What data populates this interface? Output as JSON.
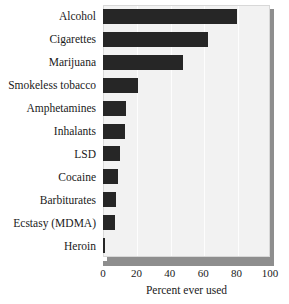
{
  "chart_data": {
    "type": "bar",
    "orientation": "horizontal",
    "title": "",
    "subtitle": "",
    "xlabel": "Percent ever used",
    "ylabel": "",
    "xlim": [
      0,
      100
    ],
    "xticks": [
      "0",
      "20",
      "40",
      "60",
      "80",
      "100"
    ],
    "xtick_values": [
      0,
      20,
      40,
      60,
      80,
      100
    ],
    "grid": "vertical",
    "legend": "none",
    "categories": [
      "Alcohol",
      "Cigarettes",
      "Marijuana",
      "Smokeless tobacco",
      "Amphetamines",
      "Inhalants",
      "LSD",
      "Cocaine",
      "Barbiturates",
      "Ecstasy (MDMA)",
      "Heroin"
    ],
    "values": [
      80,
      63,
      48,
      21,
      14,
      13,
      10,
      9,
      8,
      7,
      1
    ],
    "series": [
      {
        "name": "Percent ever used",
        "values": [
          80,
          63,
          48,
          21,
          14,
          13,
          10,
          9,
          8,
          7,
          1
        ]
      }
    ],
    "colors": {
      "bar": "#262626",
      "plot_background": "#f2f2f2",
      "gridline": "#fdfdfd",
      "shadow": "#8e8e8e",
      "axis_bar": "#8e8e8e",
      "text": "#1a1a1a",
      "figure_background": "#ffffff"
    }
  }
}
